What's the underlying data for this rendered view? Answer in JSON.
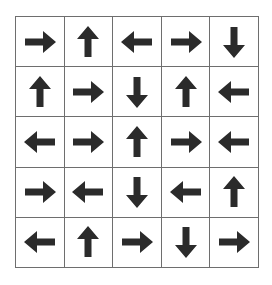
{
  "grid": {
    "rows": 5,
    "cols": 5,
    "line_color": "#6e6e6e",
    "arrow_color": "#2b2b2b",
    "cells": [
      [
        "right",
        "up",
        "left",
        "right",
        "down"
      ],
      [
        "up",
        "right",
        "down",
        "up",
        "left"
      ],
      [
        "left",
        "right",
        "up",
        "right",
        "left"
      ],
      [
        "right",
        "left",
        "down",
        "left",
        "up"
      ],
      [
        "left",
        "up",
        "right",
        "down",
        "right"
      ]
    ]
  }
}
